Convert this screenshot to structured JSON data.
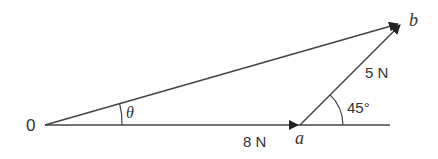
{
  "diagram": {
    "type": "vector-triangle",
    "labels": {
      "origin": "0",
      "point_a": "a",
      "point_b": "b",
      "theta": "θ",
      "force_oa": "8 N",
      "force_ab": "5 N",
      "angle": "45°"
    },
    "vectors": [
      {
        "from": "0",
        "to": "a",
        "magnitude": "8 N",
        "direction_deg": 0
      },
      {
        "from": "a",
        "to": "b",
        "magnitude": "5 N",
        "direction_deg": 45
      },
      {
        "from": "0",
        "to": "b",
        "label": "resultant",
        "angle_symbol": "θ"
      }
    ],
    "colors": {
      "stroke": "#444444",
      "text": "#333333",
      "background": "#ffffff"
    }
  }
}
